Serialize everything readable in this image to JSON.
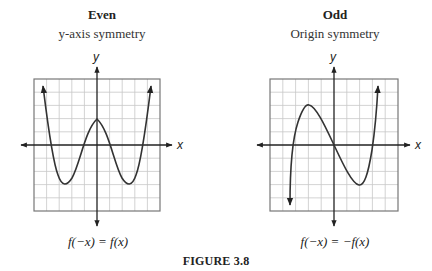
{
  "figure_label": "FIGURE 3.8",
  "panels": [
    {
      "title": "Even",
      "subtitle": "y-axis symmetry",
      "x_axis_label": "x",
      "y_axis_label": "y",
      "equation": "f(−x) = f(x)",
      "curve": "even quartic with local max on y-axis and two symmetric minima"
    },
    {
      "title": "Odd",
      "subtitle": "Origin symmetry",
      "x_axis_label": "x",
      "y_axis_label": "y",
      "equation": "f(−x) = −f(x)",
      "curve": "odd cubic passing through origin with local max left and local min right"
    }
  ],
  "colors": {
    "grid": "#c8c8c8",
    "frame": "#777777",
    "axis": "#222222",
    "curve": "#333333"
  }
}
